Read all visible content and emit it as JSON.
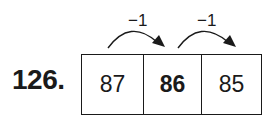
{
  "problem": {
    "number": "126.",
    "cells": [
      {
        "value": "87",
        "bold": false
      },
      {
        "value": "86",
        "bold": true
      },
      {
        "value": "85",
        "bold": false
      }
    ],
    "arrows": [
      {
        "label": "−1",
        "from": 0,
        "to": 1
      },
      {
        "label": "−1",
        "from": 1,
        "to": 2
      }
    ]
  }
}
